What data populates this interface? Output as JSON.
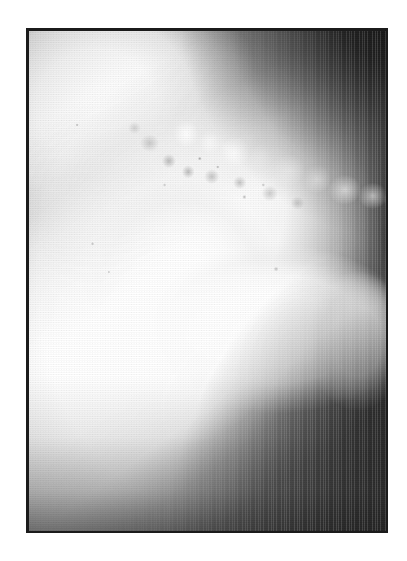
{
  "figure": {
    "kind": "radiograph",
    "modality_label": "X-ray",
    "caption": "",
    "orientation": "lateral",
    "panel": {
      "left_px": 26,
      "top_px": 28,
      "width_px": 362,
      "height_px": 505,
      "border_color": "#1b1b1b",
      "border_width_px": 3
    },
    "page": {
      "width_px": 407,
      "height_px": 561,
      "background_color": "#ffffff"
    },
    "print": {
      "screen_type": "halftone-dot",
      "dot_pitch_px": 2.6,
      "secondary_screen": "vertical-line",
      "grain": "scan-grain"
    },
    "palette": {
      "page_white": "#ffffff",
      "frame_black": "#1b1b1b",
      "bone_white": "#ffffff",
      "soft_tissue_light_gray": "#cfcfcf",
      "soft_tissue_mid_gray": "#8d8d8d",
      "background_dark_gray": "#3a3a3a",
      "background_black": "#0d0d0d"
    },
    "regions": [
      {
        "id": "bone-upper-left",
        "label": "Bright osseous mass, upper left",
        "tone": "white",
        "center_pct": [
          24,
          21
        ]
      },
      {
        "id": "bone-shaft-upper",
        "label": "Bright bone shaft ascending toward upper right",
        "tone": "white",
        "angle_deg": -28
      },
      {
        "id": "bone-center-mass",
        "label": "Central bright confluence of bone limbs",
        "tone": "white",
        "center_pct": [
          44,
          55
        ]
      },
      {
        "id": "bone-right-body",
        "label": "Broad bright body extending to the right",
        "tone": "white",
        "center_pct": [
          66,
          58
        ]
      },
      {
        "id": "bone-right-tip",
        "label": "Rounded bright terminus at right",
        "tone": "white",
        "center_pct": [
          85,
          60
        ]
      },
      {
        "id": "bone-lower-band",
        "label": "Bright diagonal band toward lower left corner",
        "tone": "white",
        "angle_deg": -36
      },
      {
        "id": "calcification-band",
        "label": "Mottled calcified speckled band along upper-right diagonal",
        "tone": "mixed light and dark flecks"
      },
      {
        "id": "soft-left-shadow",
        "label": "Pale gray rounded soft-tissue shadow, left margin",
        "tone": "light gray"
      },
      {
        "id": "tone-top-dark",
        "label": "Dark soft-tissue wedge across the top",
        "tone": "mid gray"
      },
      {
        "id": "tone-ur-dark",
        "label": "Dark background corner, upper right",
        "tone": "near black"
      },
      {
        "id": "tone-lr-dark",
        "label": "Dark background corner, lower right",
        "tone": "near black"
      },
      {
        "id": "tone-bottom-dark",
        "label": "Dark band along lower edge",
        "tone": "dark gray"
      }
    ]
  }
}
